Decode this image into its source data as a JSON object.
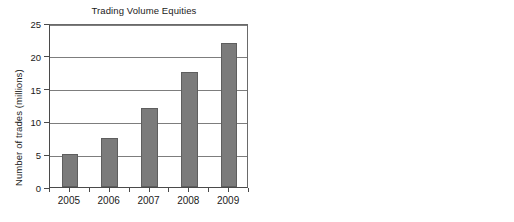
{
  "chart_data": [
    {
      "type": "bar",
      "panel": "left",
      "title": "Trading Volume Equities",
      "title_lines": [
        "Trading Volume Equities"
      ],
      "categories": [
        "2005",
        "2006",
        "2007",
        "2008",
        "2009"
      ],
      "values": [
        5,
        7.5,
        12,
        17.5,
        22
      ],
      "xlabel": "",
      "ylabel": "Number of trades (millions)",
      "ylim": [
        0,
        25
      ],
      "yticks": [
        0,
        5,
        10,
        15,
        20,
        25
      ],
      "ytick_labels": [
        "0",
        "5",
        "10",
        "15",
        "20",
        "25"
      ],
      "grid": true,
      "legend": false,
      "bar_color": "#7b7b7b",
      "bar_edge_color": "#5e5e5e",
      "grid_color": "#7d7d7d",
      "axis_color": "#4a4a4a"
    },
    {
      "type": "bar",
      "panel": "right",
      "title": "Trading Volume Equity Derivatives",
      "title_lines": [
        "Trading Volume",
        "Equity Derivatives"
      ],
      "categories": [
        "2005",
        "2006",
        "2007",
        "2008",
        "2009"
      ],
      "values": [
        50,
        100,
        320,
        450,
        180
      ],
      "xlabel": "",
      "ylabel": "Number of contracts  (millions)",
      "ylim": [
        0,
        500
      ],
      "yticks": [
        0,
        50,
        100,
        150,
        200,
        250,
        300,
        350,
        400,
        450,
        500
      ],
      "ytick_labels": [
        "0",
        "50",
        "100",
        "150",
        "200",
        "250",
        "300",
        "350",
        "400",
        "450",
        "500"
      ],
      "grid": true,
      "legend": false,
      "bar_color": "#7b7b7b",
      "bar_edge_color": "#5e5e5e",
      "grid_color": "#7d7d7d",
      "axis_color": "#4a4a4a"
    }
  ],
  "figure": {
    "background": "#ffffff",
    "panel_count": 2
  }
}
